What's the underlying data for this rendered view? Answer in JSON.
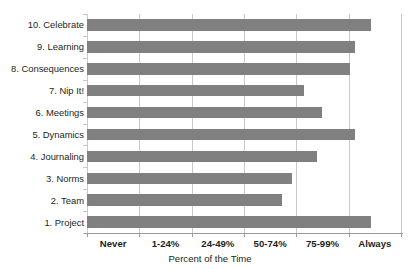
{
  "chart_data": {
    "type": "bar",
    "orientation": "horizontal",
    "title": "",
    "xlabel": "Percent of the  Time",
    "ylabel": "",
    "grid": true,
    "legend": false,
    "x_tick_labels": [
      "Never",
      "1-24%",
      "24-49%",
      "50-74%",
      "75-99%",
      "Always"
    ],
    "x_tick_centers_pct": [
      8.33,
      25.0,
      41.67,
      58.33,
      75.0,
      91.67
    ],
    "xlim": [
      0,
      100
    ],
    "categories": [
      "10. Celebrate",
      "9. Learning",
      "8. Consequences",
      "7. Nip It!",
      "6. Meetings",
      "5. Dynamics",
      "4. Journaling",
      "3. Norms",
      "2. Team",
      "1. Project"
    ],
    "values": [
      90.5,
      85.3,
      83.8,
      69.1,
      74.7,
      85.3,
      73.1,
      65.3,
      62.1,
      90.5
    ],
    "bar_color": "#808080",
    "grid_color": "#c9c9c9",
    "axis_color": "#9a9a9a",
    "text_color": "#231f20"
  }
}
